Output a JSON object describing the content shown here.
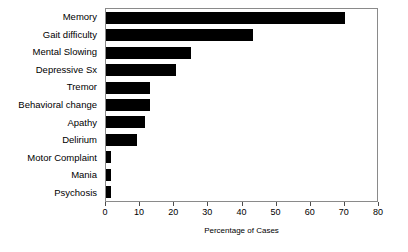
{
  "chart_data": {
    "type": "bar",
    "orientation": "horizontal",
    "title": "",
    "subtitle": "",
    "xlabel": "Percentage of Cases",
    "ylabel": "",
    "xlim": [
      0,
      80
    ],
    "xticks": [
      0,
      10,
      20,
      30,
      40,
      50,
      60,
      70,
      80
    ],
    "grid": false,
    "legend": false,
    "bar_color": "#000000",
    "frame_color": "#8a8a8a",
    "categories": [
      "Memory",
      "Gait difficulty",
      "Mental Slowing",
      "Depressive Sx",
      "Tremor",
      "Behavioral change",
      "Apathy",
      "Delirium",
      "Motor Complaint",
      "Mania",
      "Psychosis"
    ],
    "values": [
      70,
      43,
      25,
      20.5,
      13,
      13,
      11.5,
      9,
      1.5,
      1.5,
      1.5
    ]
  }
}
